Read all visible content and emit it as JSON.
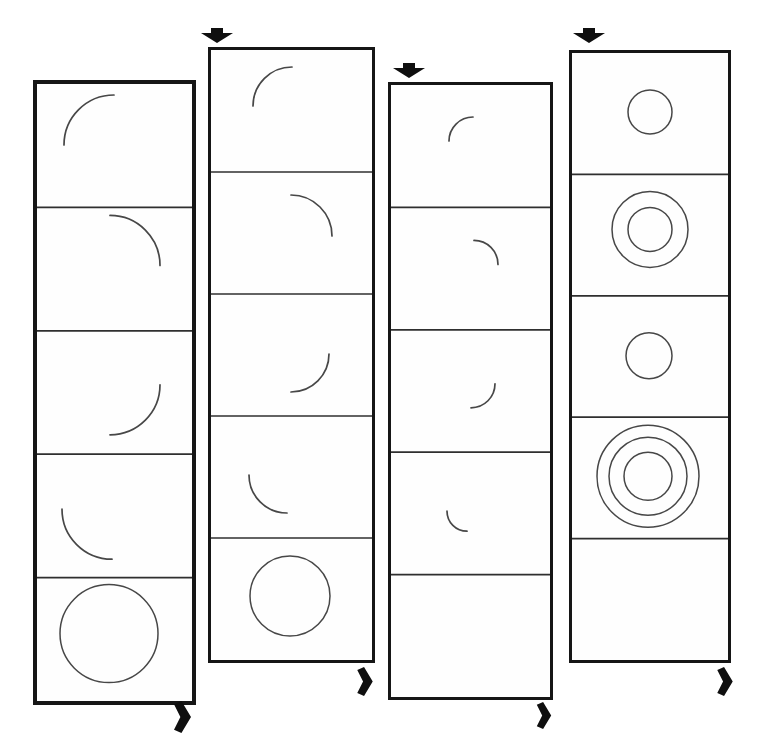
{
  "canvas": {
    "width": 757,
    "height": 743,
    "background": "#ffffff"
  },
  "colors": {
    "strip_border": "#161616",
    "frame_divider": "#2f2f2f",
    "shape_stroke": "#474747",
    "arrow_fill": "#0f0f0f",
    "cell_background": "#fefefe"
  },
  "strips": [
    {
      "id": "filmstrip-1",
      "x": 33,
      "y": 80,
      "width": 163,
      "height": 625,
      "border_px": 4,
      "cells": [
        {
          "shape": "arc",
          "quadrant": "top-left",
          "cx": 81,
          "cy": 61,
          "r": 50
        },
        {
          "shape": "arc",
          "quadrant": "top-right",
          "cx": 77,
          "cy": 58,
          "r": 50
        },
        {
          "shape": "arc",
          "quadrant": "bottom-right",
          "cx": 77,
          "cy": 54,
          "r": 50
        },
        {
          "shape": "arc",
          "quadrant": "bottom-left",
          "cx": 79,
          "cy": 55,
          "r": 50
        },
        {
          "shape": "circle",
          "cx": 76,
          "cy": 56,
          "radii": [
            49
          ]
        }
      ]
    },
    {
      "id": "filmstrip-2",
      "x": 208,
      "y": 47,
      "width": 167,
      "height": 616,
      "border_px": 3,
      "cells": [
        {
          "shape": "arc",
          "quadrant": "top-left",
          "cx": 84,
          "cy": 56,
          "r": 39
        },
        {
          "shape": "arc",
          "quadrant": "top-right",
          "cx": 83,
          "cy": 64,
          "r": 41
        },
        {
          "shape": "arc",
          "quadrant": "bottom-right",
          "cx": 83,
          "cy": 60,
          "r": 38
        },
        {
          "shape": "arc",
          "quadrant": "bottom-left",
          "cx": 79,
          "cy": 59,
          "r": 38
        },
        {
          "shape": "circle",
          "cx": 82,
          "cy": 58,
          "radii": [
            40
          ]
        }
      ]
    },
    {
      "id": "filmstrip-3",
      "x": 388,
      "y": 82,
      "width": 165,
      "height": 618,
      "border_px": 3,
      "cells": [
        {
          "shape": "arc",
          "quadrant": "top-left",
          "cx": 85,
          "cy": 56,
          "r": 24
        },
        {
          "shape": "arc",
          "quadrant": "top-right",
          "cx": 86,
          "cy": 57,
          "r": 24
        },
        {
          "shape": "arc",
          "quadrant": "bottom-right",
          "cx": 83,
          "cy": 54,
          "r": 24
        },
        {
          "shape": "arc",
          "quadrant": "bottom-left",
          "cx": 79,
          "cy": 59,
          "r": 20
        },
        {
          "shape": "empty"
        }
      ]
    },
    {
      "id": "filmstrip-4",
      "x": 569,
      "y": 50,
      "width": 162,
      "height": 613,
      "border_px": 3,
      "cells": [
        {
          "shape": "circle",
          "cx": 81,
          "cy": 59,
          "radii": [
            22
          ]
        },
        {
          "shape": "circle",
          "cx": 81,
          "cy": 55,
          "radii": [
            38,
            22
          ]
        },
        {
          "shape": "circle",
          "cx": 80,
          "cy": 60,
          "radii": [
            23
          ]
        },
        {
          "shape": "circle",
          "cx": 79,
          "cy": 59,
          "radii": [
            51,
            39,
            24
          ]
        },
        {
          "shape": "empty"
        }
      ]
    }
  ],
  "arrows": [
    {
      "id": "top-arrow-strip-2",
      "direction": "down",
      "x": 201,
      "y": 28,
      "width": 32,
      "height": 15
    },
    {
      "id": "top-arrow-strip-3",
      "direction": "down",
      "x": 393,
      "y": 63,
      "width": 32,
      "height": 15
    },
    {
      "id": "top-arrow-strip-4",
      "direction": "down",
      "x": 573,
      "y": 28,
      "width": 32,
      "height": 15
    },
    {
      "id": "bottom-arrow-strip-1",
      "direction": "right",
      "x": 174,
      "y": 701,
      "width": 17,
      "height": 32
    },
    {
      "id": "bottom-arrow-strip-2",
      "direction": "right",
      "x": 357,
      "y": 667,
      "width": 16,
      "height": 29
    },
    {
      "id": "bottom-arrow-strip-3",
      "direction": "right",
      "x": 536,
      "y": 702,
      "width": 16,
      "height": 27
    },
    {
      "id": "bottom-arrow-strip-4",
      "direction": "right",
      "x": 717,
      "y": 667,
      "width": 16,
      "height": 29
    }
  ]
}
